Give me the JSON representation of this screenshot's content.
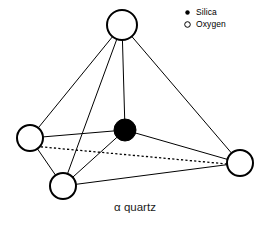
{
  "figure": {
    "caption": "α quartz",
    "background_color": "#ffffff",
    "stroke_color": "#000000",
    "atom_fill_oxygen": "#ffffff",
    "atom_fill_silica": "#000000"
  },
  "legend": {
    "items": [
      {
        "marker": "filled-dot-marker",
        "label": "Silica"
      },
      {
        "marker": "open-circle-marker",
        "label": "Oxygen"
      }
    ]
  },
  "structure": {
    "type": "tetrahedron",
    "atoms": [
      {
        "id": "oxygen-top",
        "element": "Oxygen",
        "x": 122,
        "y": 25,
        "r": 15,
        "filled": false
      },
      {
        "id": "oxygen-left",
        "element": "Oxygen",
        "x": 30,
        "y": 138,
        "r": 13,
        "filled": false
      },
      {
        "id": "oxygen-bottom",
        "element": "Oxygen",
        "x": 63,
        "y": 186,
        "r": 13,
        "filled": false
      },
      {
        "id": "oxygen-right",
        "element": "Oxygen",
        "x": 240,
        "y": 163,
        "r": 13,
        "filled": false
      },
      {
        "id": "silica-center",
        "element": "Silica",
        "x": 125,
        "y": 130,
        "r": 11,
        "filled": true
      }
    ],
    "bonds": [
      {
        "from": "oxygen-top",
        "to": "oxygen-left",
        "style": "solid"
      },
      {
        "from": "oxygen-top",
        "to": "oxygen-bottom",
        "style": "solid"
      },
      {
        "from": "oxygen-top",
        "to": "silica-center",
        "style": "solid"
      },
      {
        "from": "oxygen-top",
        "to": "oxygen-right",
        "style": "solid"
      },
      {
        "from": "oxygen-left",
        "to": "silica-center",
        "style": "solid"
      },
      {
        "from": "oxygen-left",
        "to": "oxygen-bottom",
        "style": "solid"
      },
      {
        "from": "oxygen-left",
        "to": "oxygen-right",
        "style": "dotted"
      },
      {
        "from": "silica-center",
        "to": "oxygen-bottom",
        "style": "solid"
      },
      {
        "from": "silica-center",
        "to": "oxygen-right",
        "style": "solid"
      },
      {
        "from": "oxygen-bottom",
        "to": "oxygen-right",
        "style": "solid"
      }
    ]
  }
}
